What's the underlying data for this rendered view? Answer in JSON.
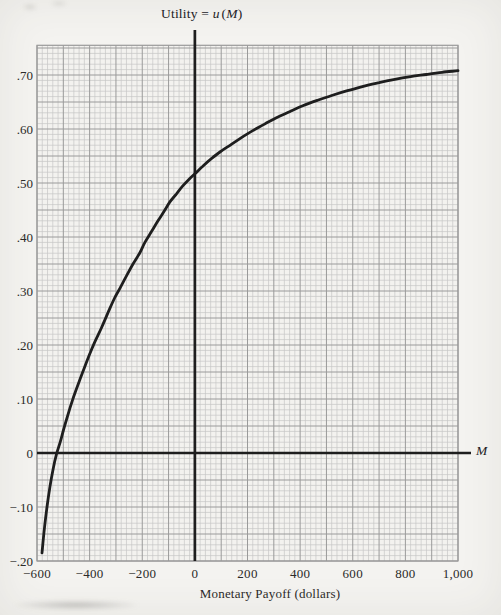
{
  "colors": {
    "paper": "#f4f3f0",
    "grid_fill": "#f3f2ef",
    "minor_line": "#c2c2c2",
    "major_line": "#9a9a9a",
    "ink": "#1e1e1e",
    "label": "#2b2a28"
  },
  "chart_data": {
    "type": "line",
    "title": {
      "prefix": "Utility = ",
      "var1": "u",
      "open": "(",
      "var2": "M",
      "close": ")"
    },
    "xlabel": "Monetary Payoff (dollars)",
    "x_axis_symbol": "M",
    "x_range": [
      -600,
      1000
    ],
    "y_range": [
      -0.2,
      0.755
    ],
    "grid": {
      "on": true,
      "minor_step_x": 20,
      "major_step_x": 100,
      "minor_step_y": 0.01,
      "major_step_y": 0.05
    },
    "axes": {
      "x_axis_at_u": 0,
      "y_axis_at_M": 0
    },
    "x_ticks": [
      {
        "value": -600,
        "label": "−600"
      },
      {
        "value": -400,
        "label": "−400"
      },
      {
        "value": -200,
        "label": "−200"
      },
      {
        "value": 0,
        "label": "0"
      },
      {
        "value": 200,
        "label": "200"
      },
      {
        "value": 400,
        "label": "400"
      },
      {
        "value": 600,
        "label": "600"
      },
      {
        "value": 800,
        "label": "800"
      },
      {
        "value": 1000,
        "label": "1,000"
      }
    ],
    "y_ticks": [
      {
        "value": 0.7,
        "label": ".70"
      },
      {
        "value": 0.6,
        "label": ".60"
      },
      {
        "value": 0.5,
        "label": ".50"
      },
      {
        "value": 0.4,
        "label": ".40"
      },
      {
        "value": 0.3,
        "label": ".30"
      },
      {
        "value": 0.2,
        "label": ".20"
      },
      {
        "value": 0.1,
        "label": ".10"
      },
      {
        "value": 0.0,
        "label": "0"
      },
      {
        "value": -0.1,
        "label": "−.10"
      },
      {
        "value": -0.2,
        "label": "−.20"
      }
    ],
    "series": [
      {
        "name": "utility-curve",
        "points": [
          [
            -581,
            -0.185
          ],
          [
            -572,
            -0.14
          ],
          [
            -562,
            -0.1
          ],
          [
            -551,
            -0.063
          ],
          [
            -539,
            -0.03
          ],
          [
            -526,
            -0.002
          ],
          [
            -512,
            0.02
          ],
          [
            -495,
            0.05
          ],
          [
            -478,
            0.078
          ],
          [
            -460,
            0.105
          ],
          [
            -440,
            0.132
          ],
          [
            -420,
            0.158
          ],
          [
            -400,
            0.183
          ],
          [
            -378,
            0.208
          ],
          [
            -355,
            0.232
          ],
          [
            -330,
            0.26
          ],
          [
            -305,
            0.287
          ],
          [
            -285,
            0.305
          ],
          [
            -260,
            0.328
          ],
          [
            -235,
            0.35
          ],
          [
            -210,
            0.37
          ],
          [
            -190,
            0.39
          ],
          [
            -165,
            0.41
          ],
          [
            -140,
            0.43
          ],
          [
            -115,
            0.449
          ],
          [
            -95,
            0.465
          ],
          [
            -70,
            0.48
          ],
          [
            -45,
            0.495
          ],
          [
            -20,
            0.508
          ],
          [
            0,
            0.517
          ],
          [
            30,
            0.531
          ],
          [
            65,
            0.546
          ],
          [
            100,
            0.559
          ],
          [
            140,
            0.572
          ],
          [
            180,
            0.585
          ],
          [
            220,
            0.597
          ],
          [
            265,
            0.609
          ],
          [
            310,
            0.621
          ],
          [
            360,
            0.632
          ],
          [
            410,
            0.643
          ],
          [
            465,
            0.653
          ],
          [
            520,
            0.662
          ],
          [
            580,
            0.671
          ],
          [
            640,
            0.679
          ],
          [
            700,
            0.686
          ],
          [
            760,
            0.692
          ],
          [
            820,
            0.697
          ],
          [
            880,
            0.701
          ],
          [
            940,
            0.705
          ],
          [
            1000,
            0.708
          ]
        ]
      }
    ]
  }
}
